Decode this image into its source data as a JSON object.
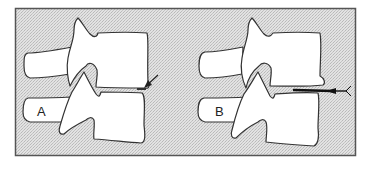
{
  "figure": {
    "panels": [
      {
        "id": "A",
        "label": "A",
        "description": "Two stacked lumbar vertebrae, lateral view; arrow points to small disc-space gap at anterior margin"
      },
      {
        "id": "B",
        "label": "B",
        "description": "Two stacked lumbar vertebrae, lateral view; needle inserted horizontally into widened disc space"
      }
    ],
    "colors": {
      "background": "#d9d9d9",
      "frame": "#555555",
      "bone_fill": "#ffffff",
      "outline": "#333333",
      "needle": "#111111"
    }
  }
}
